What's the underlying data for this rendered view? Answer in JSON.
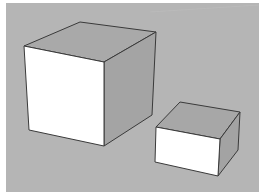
{
  "viewport": {
    "background_color": "#b5b5b5",
    "frame_color": "#ffffff",
    "edge_color": "#3a3a3a"
  },
  "scene": {
    "objects": [
      {
        "name": "large-box",
        "top_face": {
          "points": "24,46 80,22 156,32 104,62",
          "fill": "#a9a9a9"
        },
        "front_face": {
          "points": "24,46 104,62 104,146 29,130",
          "fill": "#ffffff"
        },
        "side_face": {
          "points": "104,62 156,32 152,115 104,146",
          "fill": "#a4a4a4"
        }
      },
      {
        "name": "small-box",
        "top_face": {
          "points": "156,127 180,102 240,112 220,139",
          "fill": "#a7a7a7"
        },
        "front_face": {
          "points": "156,127 220,139 218,176 155,162",
          "fill": "#ffffff"
        },
        "side_face": {
          "points": "220,139 240,112 238,150 218,176",
          "fill": "#a3a3a3"
        }
      }
    ]
  },
  "description": "3D modeling viewport showing a large cube and a smaller rectangular box"
}
